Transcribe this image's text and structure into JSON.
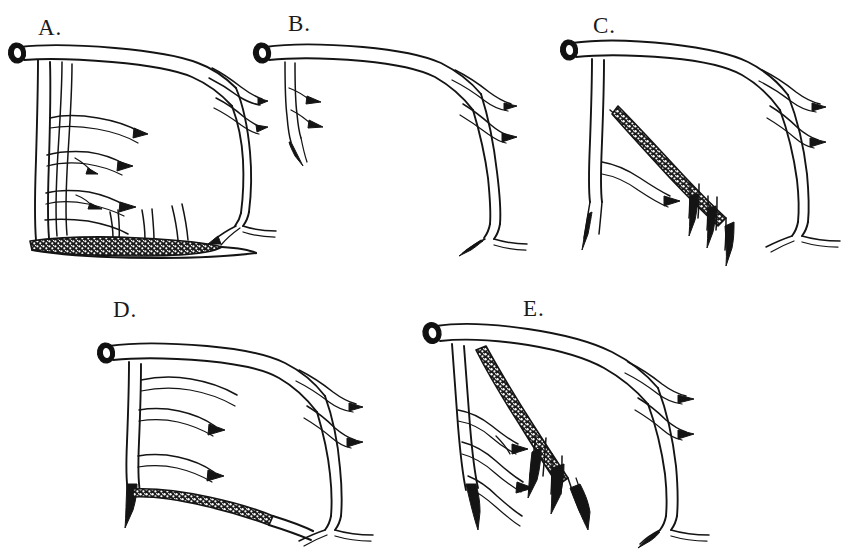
{
  "figure": {
    "background_color": "#ffffff",
    "ink_color": "#141414",
    "width": 862,
    "height": 549,
    "caption": "",
    "style": "pen-and-ink line drawing"
  },
  "panels": [
    {
      "id": "A",
      "label": "A.",
      "label_x": 38,
      "label_y": 16,
      "origin_x": 0,
      "origin_y": 30,
      "has_stipple": true,
      "stipple_location": "horizontal-basal-band",
      "branch_count": 6
    },
    {
      "id": "B",
      "label": "B.",
      "label_x": 288,
      "label_y": 12,
      "origin_x": 245,
      "origin_y": 30,
      "has_stipple": false,
      "stipple_location": "none",
      "branch_count": 2
    },
    {
      "id": "C",
      "label": "C.",
      "label_x": 593,
      "label_y": 14,
      "origin_x": 555,
      "origin_y": 30,
      "has_stipple": true,
      "stipple_location": "diagonal-band",
      "branch_count": 4
    },
    {
      "id": "D",
      "label": "D.",
      "label_x": 113,
      "label_y": 298,
      "origin_x": 85,
      "origin_y": 315,
      "has_stipple": true,
      "stipple_location": "lower-diagonal-band",
      "branch_count": 4
    },
    {
      "id": "E",
      "label": "E.",
      "label_x": 523,
      "label_y": 297,
      "origin_x": 405,
      "origin_y": 312,
      "has_stipple": true,
      "stipple_location": "diagonal-band",
      "branch_count": 6
    }
  ],
  "stipple": {
    "dot_color": "#ffffff",
    "band_fill": "#1c1c1c",
    "description": "granular speckled texture along affected root segment"
  },
  "cut_end": {
    "outer_color": "#111111",
    "inner_color": "#ffffff",
    "description": "elliptical cross-section of severed stem"
  }
}
